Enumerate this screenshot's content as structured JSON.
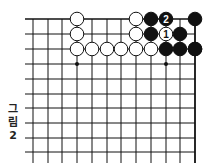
{
  "figure": {
    "caption_chars": [
      "그",
      "림",
      "2"
    ],
    "caption": "그림 2"
  },
  "board": {
    "grid": {
      "x_lines": [
        33,
        48,
        62,
        77,
        92,
        107,
        121,
        136,
        151,
        166,
        180,
        195
      ],
      "y_lines": [
        19,
        34,
        49,
        64,
        79,
        94,
        108,
        123,
        138,
        152
      ],
      "bottom_extent": 163,
      "left_extent": 25,
      "top_edge": true,
      "right_edge": true
    },
    "star_points": [
      [
        2,
        3
      ],
      [
        8,
        3
      ]
    ],
    "stones": [
      {
        "col": 2,
        "row": 0,
        "color": "white"
      },
      {
        "col": 2,
        "row": 1,
        "color": "white"
      },
      {
        "col": 2,
        "row": 2,
        "color": "white"
      },
      {
        "col": 3,
        "row": 2,
        "color": "white"
      },
      {
        "col": 4,
        "row": 2,
        "color": "white"
      },
      {
        "col": 5,
        "row": 2,
        "color": "white"
      },
      {
        "col": 6,
        "row": 2,
        "color": "white"
      },
      {
        "col": 7,
        "row": 2,
        "color": "white"
      },
      {
        "col": 6,
        "row": 0,
        "color": "white"
      },
      {
        "col": 6,
        "row": 1,
        "color": "white"
      },
      {
        "col": 7,
        "row": 0,
        "color": "black"
      },
      {
        "col": 7,
        "row": 1,
        "color": "black"
      },
      {
        "col": 8,
        "row": 0,
        "color": "black",
        "label": "2"
      },
      {
        "col": 8,
        "row": 1,
        "color": "white",
        "label": "1"
      },
      {
        "col": 9,
        "row": 1,
        "color": "black"
      },
      {
        "col": 10,
        "row": 0,
        "color": "black"
      },
      {
        "col": 8,
        "row": 2,
        "color": "black"
      },
      {
        "col": 9,
        "row": 2,
        "color": "black"
      },
      {
        "col": 10,
        "row": 2,
        "color": "black"
      },
      {
        "col": 11,
        "row": 2,
        "color": "black"
      }
    ]
  }
}
